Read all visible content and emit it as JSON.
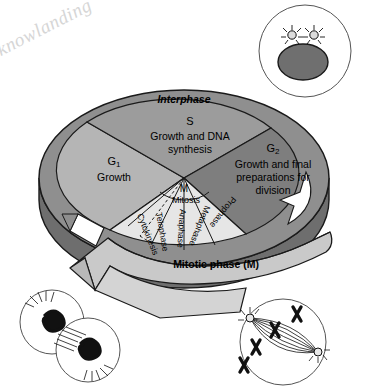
{
  "figure": {
    "watermark": "knowlanding"
  },
  "colors": {
    "interphase_ring": "#8f8f8f",
    "g1_wedge": "#b5b5b5",
    "s_wedge": "#9c9c9c",
    "g2_wedge": "#7e7e7e",
    "mitotic_wedge": "#e6e6e6",
    "disk_side": "#6e6e6e",
    "arrow_band": "#c9c9c9",
    "outline": "#1a1a1a",
    "cell_nucleus": "#6f6f6f",
    "cell_body": "#ffffff"
  },
  "ring": {
    "label": "Interphase"
  },
  "interphase_wedges": [
    {
      "id": "g1",
      "symbol": "G",
      "subscript": "1",
      "description": "Growth"
    },
    {
      "id": "s",
      "symbol": "S",
      "subscript": "",
      "description_line1": "Growth and DNA",
      "description_line2": "synthesis"
    },
    {
      "id": "g2",
      "symbol": "G",
      "subscript": "2",
      "description_line1": "Growth and final",
      "description_line2": "preparations for",
      "description_line3": "division"
    }
  ],
  "mitotic": {
    "center_symbol": "M",
    "center_label": "Mitosis",
    "band_label": "Mitotic phase (M)",
    "substages": [
      "Cytokinesis",
      "Telophase",
      "Anaphase",
      "Metaphase",
      "Prophase"
    ]
  },
  "cell_illustrations": [
    {
      "id": "interphase-cell",
      "name": "interphase-cell-illustration",
      "position": "top-right",
      "features": "cell with large nucleus and two centrosomes"
    },
    {
      "id": "telophase-cytokinesis-cells",
      "name": "telophase-cytokinesis-illustration",
      "position": "bottom-left",
      "features": "two daughter cells separating with decondensing chromosomes"
    },
    {
      "id": "metaphase-anaphase-cell",
      "name": "metaphase-anaphase-illustration",
      "position": "bottom-right",
      "features": "cell with mitotic spindle, centrosomes and chromosomes"
    }
  ]
}
